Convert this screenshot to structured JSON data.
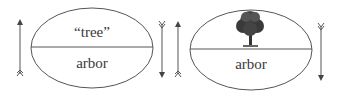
{
  "diagram": {
    "left_sign": {
      "signified_text": "“tree”",
      "signifier_text": "arbor"
    },
    "right_sign": {
      "signified_icon": "tree-icon",
      "signifier_text": "arbor"
    },
    "arrows": [
      "arrow-up",
      "arrow-down",
      "arrow-up",
      "arrow-down"
    ],
    "colors": {
      "stroke": "#444444",
      "text": "#3a3a3a"
    }
  }
}
